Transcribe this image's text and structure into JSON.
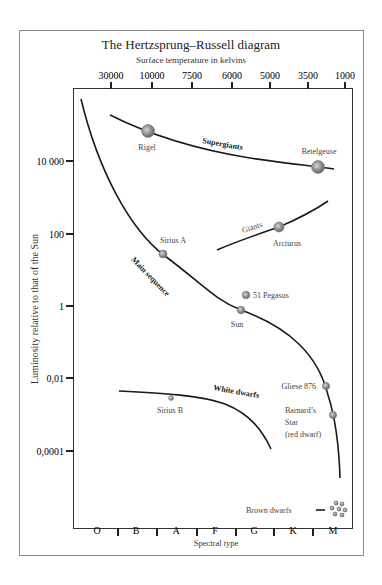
{
  "title": "The Hertzsprung–Russell diagram",
  "top_axis": {
    "label": "Surface temperature in kelvins",
    "ticks": [
      {
        "label": "30000",
        "x": 111
      },
      {
        "label": "10000",
        "x": 152
      },
      {
        "label": "7500",
        "x": 192
      },
      {
        "label": "6000",
        "x": 232
      },
      {
        "label": "5000",
        "x": 270
      },
      {
        "label": "3500",
        "x": 308
      },
      {
        "label": "1000",
        "x": 345
      }
    ]
  },
  "left_axis": {
    "label": "Luminosity relative to that of the Sun",
    "ticks": [
      {
        "label": "10 000",
        "y": 161
      },
      {
        "label": "100",
        "y": 234
      },
      {
        "label": "1",
        "y": 306
      },
      {
        "label": "0,01",
        "y": 378
      },
      {
        "label": "0,0001",
        "y": 451
      }
    ]
  },
  "bottom_axis": {
    "label": "Spectral type",
    "classes": [
      {
        "label": "O",
        "x": 97
      },
      {
        "label": "B",
        "x": 136
      },
      {
        "label": "A",
        "x": 176
      },
      {
        "label": "F",
        "x": 215
      },
      {
        "label": "G",
        "x": 254
      },
      {
        "label": "K",
        "x": 293
      },
      {
        "label": "M",
        "x": 333
      }
    ],
    "tick_x": [
      118,
      157,
      197,
      236,
      274,
      313
    ]
  },
  "regions": {
    "main_sequence": "Main sequence",
    "supergiants": "Supergiants",
    "giants": "Giants",
    "white_dwarfs": "White dwarfs",
    "brown_dwarfs": "Brown dwarfs"
  },
  "stars": [
    {
      "name": "Rigel",
      "x": 148,
      "y": 131,
      "r": 6.5
    },
    {
      "name": "Betelgeuse",
      "x": 318,
      "y": 167,
      "r": 6.5
    },
    {
      "name": "Arcturus",
      "x": 279,
      "y": 227,
      "r": 5
    },
    {
      "name": "Sirius A",
      "x": 163,
      "y": 254,
      "r": 4
    },
    {
      "name": "51 Pegasus",
      "x": 246,
      "y": 295,
      "r": 3.8
    },
    {
      "name": "Sun",
      "x": 241,
      "y": 310,
      "r": 3.8
    },
    {
      "name": "Gliese 876",
      "x": 326,
      "y": 386,
      "r": 3.6
    },
    {
      "name": "Barnard’s",
      "x": 333,
      "y": 415,
      "r": 3.6
    },
    {
      "name": "Sirius B",
      "x": 171,
      "y": 398,
      "r": 2.5
    }
  ],
  "star_labels": {
    "barnard_line2": "Star",
    "barnard_line3": "(red dwarf)"
  },
  "colors": {
    "frame": "#888888",
    "curve": "#1a1a1a",
    "star_fill": "#8a8a8a",
    "text": "#333333"
  }
}
